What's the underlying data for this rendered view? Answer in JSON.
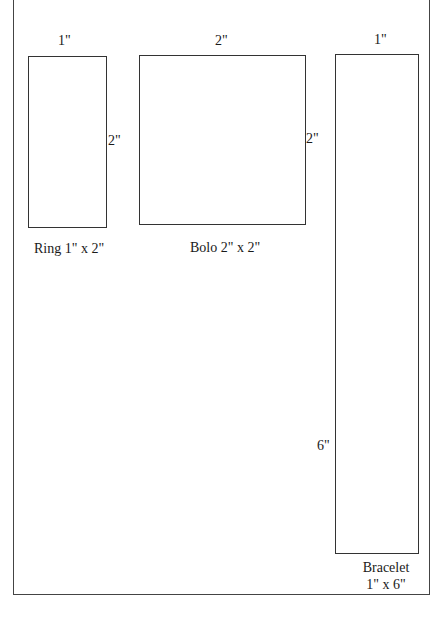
{
  "templates": [
    {
      "id": "ring",
      "name_label": "Ring 1\" x 2\"",
      "width_label": "1\"",
      "height_label": "2\""
    },
    {
      "id": "bolo",
      "name_label": "Bolo 2\" x 2\"",
      "width_label": "2\"",
      "height_label": "2\""
    },
    {
      "id": "bracelet",
      "name_label_line1": "Bracelet",
      "name_label_line2": "1\" x 6\"",
      "width_label": "1\"",
      "height_label": "6\""
    }
  ]
}
